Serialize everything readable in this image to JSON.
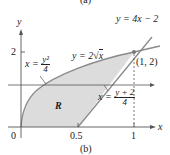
{
  "caption_top": "(a)",
  "caption": "(b)",
  "axes": {
    "x_label": "x",
    "y_label": "y",
    "x_ticks": [
      "0",
      "0.5",
      "1"
    ],
    "y_ticks": [
      "2"
    ]
  },
  "curves": {
    "sqrt_label_lhs": "y = 2",
    "sqrt_label_rad": "x",
    "line_label": "y = 4x − 2",
    "inv_parabola_lhs": "x =",
    "inv_parabola_num": "y²",
    "inv_parabola_den": "4",
    "inv_line_lhs": "x =",
    "inv_line_num": "y + 2",
    "inv_line_den": "4"
  },
  "point_label": "(1, 2)",
  "region_label": "R",
  "colors": {
    "region_fill": "#dcdcdc",
    "curve": "#8a8a8a",
    "axis": "#555555"
  }
}
